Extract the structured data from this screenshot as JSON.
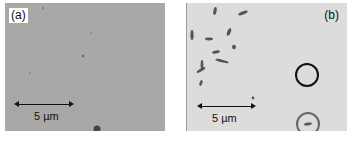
{
  "figure": {
    "panels": [
      {
        "label": "(a)",
        "scale_bar": "5 µm"
      },
      {
        "label": "(b)",
        "scale_bar": "5 µm"
      }
    ]
  }
}
